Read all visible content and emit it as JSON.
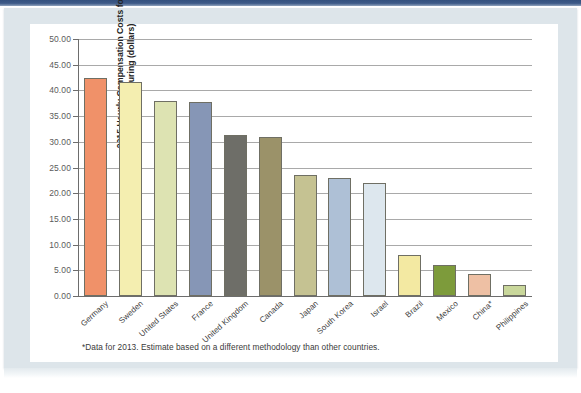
{
  "figure": {
    "y_axis_title_line1": "2015 Hourly Compensation Costs for",
    "y_axis_title_line2": "Manufacturing (dollars)",
    "footnote": "*Data for 2013. Estimate based on a different methodology than other countries."
  },
  "chart_data": {
    "type": "bar",
    "title": "",
    "xlabel": "",
    "ylabel": "2015 Hourly Compensation Costs for Manufacturing (dollars)",
    "ylim": [
      0,
      50
    ],
    "ytick_labels": [
      "50.00",
      "45.00",
      "40.00",
      "35.00",
      "30.00",
      "25.00",
      "20.00",
      "15.00",
      "10.00",
      "5.00",
      "0.00"
    ],
    "ytick_values": [
      50,
      45,
      40,
      35,
      30,
      25,
      20,
      15,
      10,
      5,
      0
    ],
    "grid": true,
    "legend": "none",
    "categories": [
      "Germany",
      "Sweden",
      "United States",
      "France",
      "United Kingdom",
      "Canada",
      "Japan",
      "South Korea",
      "Israel",
      "Brazil",
      "Mexico",
      "China*",
      "Philippines"
    ],
    "values": [
      42.4,
      41.7,
      37.9,
      37.8,
      31.4,
      31.0,
      23.6,
      22.9,
      21.9,
      7.9,
      6.1,
      4.2,
      2.1
    ],
    "colors": [
      "#f09169",
      "#f4eeb0",
      "#dde3b2",
      "#8696b6",
      "#6e6e68",
      "#9b9269",
      "#c5c292",
      "#aec0d6",
      "#dde7ee",
      "#f3e9a2",
      "#7d9b3b",
      "#eec0a4",
      "#c9d79b"
    ],
    "bar_edge_color": "#6f6f64",
    "axis_color": "#6d6d6d",
    "gridline_color": "#a9a9a9",
    "annotations": [
      "*Data for 2013. Estimate based on a different methodology than other countries."
    ]
  },
  "frame": {
    "accent_bar_color": "#3d5a88",
    "panel_color": "#dde5ea",
    "plot_background": "#ffffff"
  }
}
